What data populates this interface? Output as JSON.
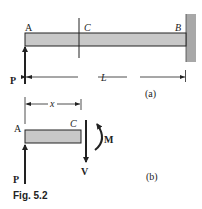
{
  "figure": {
    "caption": "Fig. 5.2",
    "colors": {
      "beam_fill": "#c8c8c8",
      "wall_fill": "#a8a8a8",
      "stroke": "#222222"
    },
    "part_a": {
      "label": "(a)",
      "points": {
        "A": "A",
        "C": "C",
        "B": "B"
      },
      "load": "P",
      "dimension": "L"
    },
    "part_b": {
      "label": "(b)",
      "points": {
        "A": "A",
        "C": "C"
      },
      "load": "P",
      "dimension": "x",
      "shear": "V",
      "moment": "M"
    }
  }
}
